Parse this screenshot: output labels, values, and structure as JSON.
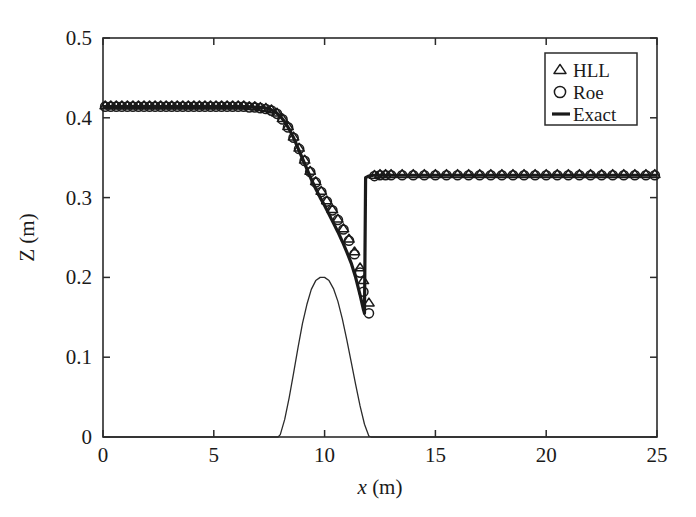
{
  "figure": {
    "background_color": "#ffffff",
    "line_color": "#1a1a1a"
  },
  "axes": {
    "x_title_symbol": "x",
    "x_title_unit": " (m)",
    "y_title_symbol": "Z",
    "y_title_unit": " (m)",
    "x_ticks": [
      "0",
      "5",
      "10",
      "15",
      "20",
      "25"
    ],
    "y_ticks": [
      "0",
      "0.1",
      "0.2",
      "0.3",
      "0.4",
      "0.5"
    ]
  },
  "legend": {
    "items": [
      {
        "label": "HLL",
        "marker": "triangle-up-marker"
      },
      {
        "label": "Roe",
        "marker": "circle-marker"
      },
      {
        "label": "Exact",
        "marker": "line-marker"
      }
    ]
  },
  "chart_data": {
    "type": "line",
    "title": "",
    "xlabel": "x (m)",
    "ylabel": "Z (m)",
    "xlim": [
      0,
      25
    ],
    "ylim": [
      0,
      0.5
    ],
    "xticks": [
      0,
      5,
      10,
      15,
      20,
      25
    ],
    "yticks": [
      0,
      0.1,
      0.2,
      0.3,
      0.4,
      0.5
    ],
    "grid": false,
    "legend_position": "upper right",
    "series": [
      {
        "name": "Exact",
        "style": "thick-solid-line",
        "x": [
          0.0,
          0.5,
          1.0,
          1.5,
          2.0,
          2.5,
          3.0,
          3.5,
          4.0,
          4.5,
          5.0,
          5.5,
          6.0,
          6.5,
          7.0,
          7.2,
          7.4,
          7.6,
          7.8,
          8.0,
          8.2,
          8.4,
          8.6,
          8.8,
          9.0,
          9.2,
          9.4,
          9.6,
          9.8,
          10.0,
          10.2,
          10.4,
          10.6,
          10.8,
          11.0,
          11.2,
          11.4,
          11.6,
          11.75,
          11.8,
          11.85,
          12.0,
          12.2,
          12.5,
          13.0,
          13.5,
          14.0,
          15.0,
          16.0,
          17.0,
          18.0,
          19.0,
          20.0,
          21.0,
          22.0,
          23.0,
          24.0,
          25.0
        ],
        "y": [
          0.414,
          0.414,
          0.414,
          0.414,
          0.414,
          0.414,
          0.414,
          0.414,
          0.414,
          0.414,
          0.414,
          0.414,
          0.414,
          0.414,
          0.413,
          0.413,
          0.412,
          0.41,
          0.407,
          0.402,
          0.395,
          0.386,
          0.375,
          0.362,
          0.349,
          0.336,
          0.323,
          0.311,
          0.3,
          0.29,
          0.279,
          0.268,
          0.257,
          0.245,
          0.232,
          0.218,
          0.2,
          0.178,
          0.16,
          0.155,
          0.325,
          0.327,
          0.328,
          0.328,
          0.328,
          0.328,
          0.328,
          0.328,
          0.328,
          0.328,
          0.328,
          0.328,
          0.328,
          0.328,
          0.328,
          0.328,
          0.328,
          0.328
        ]
      },
      {
        "name": "HLL",
        "style": "triangle-up-markers",
        "x": [
          0.1,
          0.35,
          0.6,
          0.85,
          1.1,
          1.35,
          1.6,
          1.85,
          2.1,
          2.35,
          2.6,
          2.85,
          3.1,
          3.35,
          3.6,
          3.85,
          4.1,
          4.35,
          4.6,
          4.85,
          5.1,
          5.35,
          5.6,
          5.85,
          6.1,
          6.35,
          6.6,
          6.85,
          7.1,
          7.35,
          7.6,
          7.85,
          8.1,
          8.35,
          8.6,
          8.85,
          9.1,
          9.35,
          9.6,
          9.85,
          10.1,
          10.35,
          10.6,
          10.85,
          11.1,
          11.35,
          11.6,
          11.75,
          12.0,
          12.25,
          12.5,
          12.75,
          13.0,
          13.5,
          14.0,
          14.5,
          15.0,
          15.5,
          16.0,
          16.5,
          17.0,
          17.5,
          18.0,
          18.5,
          19.0,
          19.5,
          20.0,
          20.5,
          21.0,
          21.5,
          22.0,
          22.5,
          23.0,
          23.5,
          24.0,
          24.5,
          24.9
        ],
        "y": [
          0.415,
          0.415,
          0.415,
          0.415,
          0.415,
          0.415,
          0.415,
          0.415,
          0.415,
          0.415,
          0.415,
          0.415,
          0.415,
          0.415,
          0.415,
          0.415,
          0.415,
          0.415,
          0.415,
          0.415,
          0.415,
          0.415,
          0.415,
          0.415,
          0.415,
          0.415,
          0.414,
          0.414,
          0.413,
          0.412,
          0.41,
          0.406,
          0.399,
          0.389,
          0.376,
          0.362,
          0.347,
          0.333,
          0.32,
          0.308,
          0.296,
          0.285,
          0.273,
          0.261,
          0.248,
          0.232,
          0.212,
          0.196,
          0.168,
          0.328,
          0.329,
          0.329,
          0.329,
          0.329,
          0.329,
          0.329,
          0.329,
          0.329,
          0.329,
          0.329,
          0.329,
          0.329,
          0.329,
          0.329,
          0.329,
          0.329,
          0.329,
          0.329,
          0.329,
          0.329,
          0.329,
          0.329,
          0.329,
          0.329,
          0.329,
          0.329,
          0.329
        ]
      },
      {
        "name": "Roe",
        "style": "circle-markers",
        "x": [
          0.1,
          0.35,
          0.6,
          0.85,
          1.1,
          1.35,
          1.6,
          1.85,
          2.1,
          2.35,
          2.6,
          2.85,
          3.1,
          3.35,
          3.6,
          3.85,
          4.1,
          4.35,
          4.6,
          4.85,
          5.1,
          5.35,
          5.6,
          5.85,
          6.1,
          6.35,
          6.6,
          6.85,
          7.1,
          7.35,
          7.6,
          7.85,
          8.1,
          8.35,
          8.6,
          8.85,
          9.1,
          9.35,
          9.6,
          9.85,
          10.1,
          10.35,
          10.6,
          10.85,
          11.1,
          11.35,
          11.6,
          11.75,
          12.0,
          12.25,
          12.5,
          12.75,
          13.0,
          13.5,
          14.0,
          14.5,
          15.0,
          15.5,
          16.0,
          16.5,
          17.0,
          17.5,
          18.0,
          18.5,
          19.0,
          19.5,
          20.0,
          20.5,
          21.0,
          21.5,
          22.0,
          22.5,
          23.0,
          23.5,
          24.0,
          24.5,
          24.9
        ],
        "y": [
          0.414,
          0.414,
          0.414,
          0.414,
          0.414,
          0.414,
          0.414,
          0.414,
          0.414,
          0.414,
          0.414,
          0.414,
          0.414,
          0.414,
          0.414,
          0.414,
          0.414,
          0.414,
          0.414,
          0.414,
          0.414,
          0.414,
          0.414,
          0.414,
          0.414,
          0.414,
          0.413,
          0.413,
          0.412,
          0.411,
          0.409,
          0.405,
          0.398,
          0.388,
          0.375,
          0.361,
          0.346,
          0.332,
          0.319,
          0.307,
          0.295,
          0.284,
          0.272,
          0.26,
          0.246,
          0.229,
          0.206,
          0.182,
          0.155,
          0.327,
          0.328,
          0.328,
          0.328,
          0.328,
          0.328,
          0.328,
          0.328,
          0.328,
          0.328,
          0.328,
          0.328,
          0.328,
          0.328,
          0.328,
          0.328,
          0.328,
          0.328,
          0.328,
          0.328,
          0.328,
          0.328,
          0.328,
          0.328,
          0.328,
          0.328,
          0.328,
          0.328
        ]
      },
      {
        "name": "Bed",
        "style": "thin-solid-line",
        "x": [
          0.0,
          7.9,
          8.0,
          8.2,
          8.4,
          8.6,
          8.8,
          9.0,
          9.2,
          9.4,
          9.6,
          9.8,
          10.0,
          10.2,
          10.4,
          10.6,
          10.8,
          11.0,
          11.2,
          11.4,
          11.6,
          11.8,
          12.0,
          12.1,
          25.0
        ],
        "y": [
          0.0,
          0.0,
          0.003,
          0.022,
          0.049,
          0.08,
          0.112,
          0.142,
          0.166,
          0.185,
          0.196,
          0.2,
          0.2,
          0.196,
          0.186,
          0.17,
          0.148,
          0.122,
          0.094,
          0.066,
          0.039,
          0.016,
          0.001,
          0.0,
          0.0
        ]
      }
    ]
  }
}
